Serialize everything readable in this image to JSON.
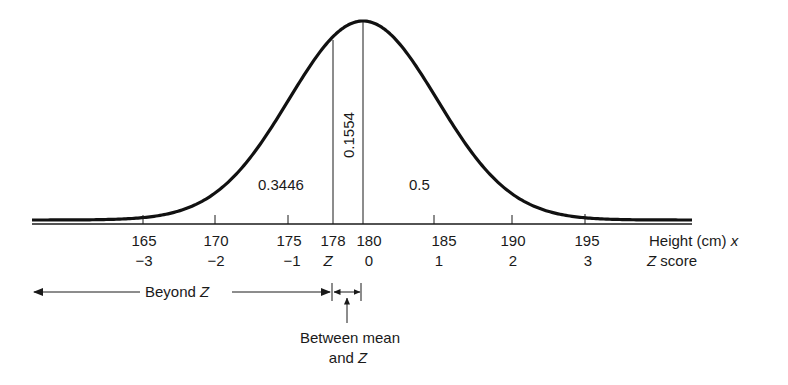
{
  "chart_data": {
    "type": "area",
    "title": "",
    "distribution": "normal",
    "mean": 180,
    "sd": 5,
    "xlabel": "Height (cm) x",
    "xlabel2": "Z score",
    "x_ticks": [
      {
        "x": 165,
        "z": "−3"
      },
      {
        "x": 170,
        "z": "−2"
      },
      {
        "x": 175,
        "z": "−1"
      },
      {
        "x": 178,
        "z": "Z"
      },
      {
        "x": 180,
        "z": "0"
      },
      {
        "x": 185,
        "z": "1"
      },
      {
        "x": 190,
        "z": "2"
      },
      {
        "x": 195,
        "z": "3"
      }
    ],
    "areas": [
      {
        "region": "beyond Z (x < 178)",
        "value": 0.3446
      },
      {
        "region": "between mean and Z (178 to 180)",
        "value": 0.1554
      },
      {
        "region": "above mean (x > 180)",
        "value": 0.5
      }
    ],
    "grid": false,
    "legend": null
  },
  "labels": {
    "area_left": "0.3446",
    "area_between": "0.1554",
    "area_right": "0.5",
    "axis_x_title": "Height (cm) ",
    "axis_x_var": "x",
    "axis_z_var": "Z",
    "axis_z_title": " score",
    "ticks_x": [
      "165",
      "170",
      "175",
      "178",
      "180",
      "185",
      "190",
      "195"
    ],
    "ticks_z": [
      "−3",
      "−2",
      "−1",
      "Z",
      "0",
      "1",
      "2",
      "3"
    ],
    "beyond_prefix": "Beyond ",
    "beyond_var": "Z",
    "between_line1": "Between mean",
    "between_line2_prefix": "and ",
    "between_line2_var": "Z"
  }
}
